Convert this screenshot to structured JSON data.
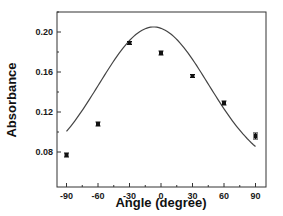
{
  "chart_data": {
    "type": "scatter",
    "title": "",
    "xlabel": "Angle (degree)",
    "ylabel": "Absorbance",
    "xlim": [
      -100,
      100
    ],
    "ylim": [
      0.065,
      0.22
    ],
    "xticks": [
      -90,
      -60,
      -30,
      0,
      30,
      60,
      90
    ],
    "xtick_labels": [
      "-90",
      "-60",
      "-30",
      "0",
      "30",
      "60",
      "90"
    ],
    "yticks": [
      0.08,
      0.12,
      0.16,
      0.2
    ],
    "ytick_labels": [
      "0.08",
      "0.12",
      "0.16",
      "0.20"
    ],
    "grid": false,
    "legend": null,
    "series": [
      {
        "name": "measured",
        "kind": "points-with-errorbars",
        "x": [
          -90,
          -60,
          -30,
          0,
          30,
          60,
          90
        ],
        "y": [
          0.077,
          0.108,
          0.189,
          0.179,
          0.156,
          0.129,
          0.096
        ],
        "yerr": [
          0.002,
          0.002,
          0.001,
          0.002,
          0.001,
          0.002,
          0.003
        ]
      },
      {
        "name": "fit",
        "kind": "line",
        "x": [
          -90,
          -75,
          -60,
          -45,
          -30,
          -15,
          -7,
          0,
          15,
          30,
          45,
          60,
          75,
          90
        ],
        "y": [
          0.085,
          0.105,
          0.13,
          0.158,
          0.184,
          0.201,
          0.205,
          0.203,
          0.188,
          0.16,
          0.13,
          0.106,
          0.088,
          0.077
        ]
      }
    ]
  },
  "colors": {
    "axis": "#333333",
    "points": "#111111",
    "curve": "#444444"
  }
}
